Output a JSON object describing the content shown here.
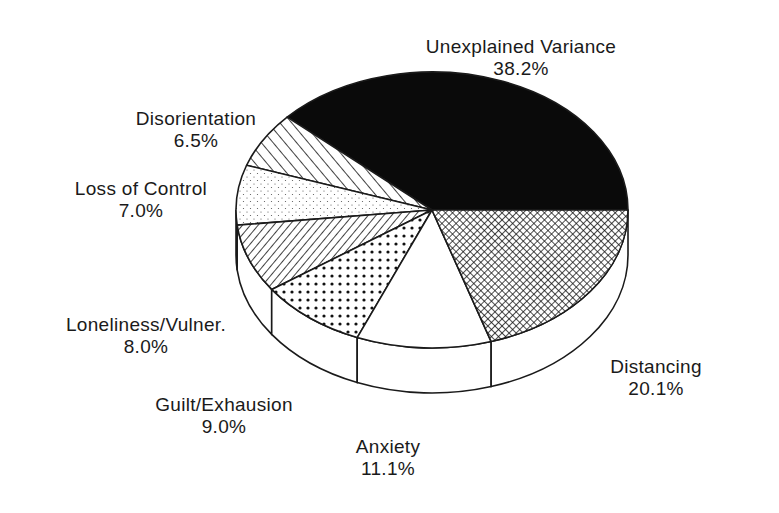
{
  "chart_data": {
    "type": "pie",
    "style": "3d-pie-monochrome-patterns",
    "title": "",
    "slices": [
      {
        "label": "Unexplained Variance",
        "value": 38.2,
        "pct_text": "38.2%",
        "pattern": "solid-black",
        "color": "#0a0a0a"
      },
      {
        "label": "Disorientation",
        "value": 6.5,
        "pct_text": "6.5%",
        "pattern": "diagonal-backslash-wide",
        "color": "#ffffff"
      },
      {
        "label": "Loss of Control",
        "value": 7.0,
        "pct_text": "7.0%",
        "pattern": "sparse-dots",
        "color": "#ffffff"
      },
      {
        "label": "Loneliness/Vulner.",
        "value": 8.0,
        "pct_text": "8.0%",
        "pattern": "diagonal-slash-dense",
        "color": "#ffffff"
      },
      {
        "label": "Guilt/Exhausion",
        "value": 9.0,
        "pct_text": "9.0%",
        "pattern": "bold-dots",
        "color": "#ffffff"
      },
      {
        "label": "Anxiety",
        "value": 11.1,
        "pct_text": "11.1%",
        "pattern": "blank",
        "color": "#ffffff"
      },
      {
        "label": "Distancing",
        "value": 20.1,
        "pct_text": "20.1%",
        "pattern": "crosshatch",
        "color": "#ffffff"
      }
    ],
    "start_angle_deg": 0,
    "direction": "counter-clockwise",
    "legend": "none (labels placed beside slices)"
  },
  "labels": {
    "unexplained": {
      "name": "Unexplained Variance",
      "pct": "38.2%"
    },
    "disorientation": {
      "name": "Disorientation",
      "pct": "6.5%"
    },
    "loss_of_control": {
      "name": "Loss of Control",
      "pct": "7.0%"
    },
    "loneliness": {
      "name": "Loneliness/Vulner.",
      "pct": "8.0%"
    },
    "guilt": {
      "name": "Guilt/Exhausion",
      "pct": "9.0%"
    },
    "anxiety": {
      "name": "Anxiety",
      "pct": "11.1%"
    },
    "distancing": {
      "name": "Distancing",
      "pct": "20.1%"
    }
  }
}
